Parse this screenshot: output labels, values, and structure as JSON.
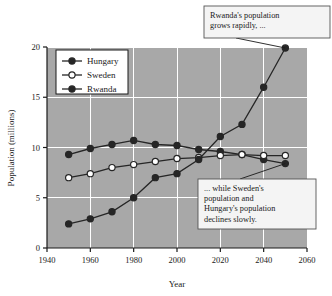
{
  "chart_data": {
    "type": "line",
    "title": "",
    "xlabel": "Year",
    "ylabel": "Population (millions)",
    "xlim": [
      1940,
      2060
    ],
    "ylim": [
      0,
      20
    ],
    "xticks": [
      1940,
      1960,
      1980,
      2000,
      2020,
      2040,
      2060
    ],
    "yticks": [
      0,
      5,
      10,
      15,
      20
    ],
    "grid": true,
    "legend_position": "top-left",
    "plot_background": "#a8a8a8",
    "gridline_color": "#ffffff",
    "line_color": "#262626",
    "x": [
      1950,
      1960,
      1970,
      1980,
      1990,
      2000,
      2010,
      2020,
      2030,
      2040,
      2050
    ],
    "series": [
      {
        "name": "Hungary",
        "marker": "filled-circle",
        "color": "#262626",
        "values": [
          9.3,
          9.9,
          10.3,
          10.7,
          10.3,
          10.2,
          9.8,
          9.6,
          9.3,
          8.8,
          8.4
        ]
      },
      {
        "name": "Sweden",
        "marker": "open-circle",
        "color": "#ffffff",
        "values": [
          7.0,
          7.4,
          8.0,
          8.3,
          8.6,
          8.9,
          9.0,
          9.2,
          9.3,
          9.2,
          9.2
        ]
      },
      {
        "name": "Rwanda",
        "marker": "filled-circle",
        "color": "#262626",
        "values": [
          2.4,
          2.9,
          3.6,
          5.0,
          7.0,
          7.4,
          8.8,
          11.1,
          12.3,
          16.0,
          19.9
        ]
      }
    ],
    "annotations": [
      {
        "id": "rwanda-callout",
        "text": "Rwanda's population grows rapidly, ...",
        "lines": [
          "Rwanda's population",
          "grows rapidly, ..."
        ],
        "points_to": {
          "x": 2050,
          "y": 19.9
        }
      },
      {
        "id": "decline-callout",
        "text": "... while Sweden's population and Hungary's population declines slowly.",
        "lines": [
          "... while Sweden's",
          "population and",
          "Hungary's population",
          "declines slowly."
        ],
        "points_to": {
          "x": 2050,
          "y": 8.4
        }
      }
    ]
  },
  "legend": {
    "entries": [
      {
        "label": "Hungary"
      },
      {
        "label": "Sweden"
      },
      {
        "label": "Rwanda"
      }
    ]
  }
}
